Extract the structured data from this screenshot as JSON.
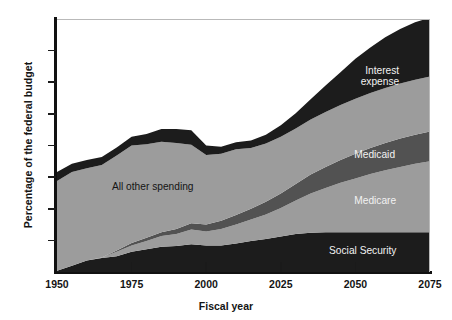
{
  "chart_data": {
    "type": "area",
    "stacked": true,
    "title": "",
    "xlabel": "Fiscal year",
    "ylabel": "Percentage of the federal budget",
    "xlim": [
      1950,
      2075
    ],
    "ylim": [
      0,
      40
    ],
    "xticks": [
      1950,
      1975,
      2000,
      2025,
      2050,
      2075
    ],
    "yticks": [
      0,
      5,
      10,
      15,
      20,
      25,
      30,
      35,
      40
    ],
    "grid": false,
    "legend_position": "inline-annotations",
    "x": [
      1950,
      1955,
      1960,
      1965,
      1970,
      1975,
      1980,
      1985,
      1990,
      1995,
      2000,
      2005,
      2010,
      2015,
      2020,
      2025,
      2030,
      2035,
      2040,
      2045,
      2050,
      2055,
      2060,
      2065,
      2070,
      2075
    ],
    "series": [
      {
        "name": "Social Security",
        "color": "#1c1c1c",
        "values": [
          0.2,
          1.0,
          1.8,
          2.2,
          2.5,
          3.2,
          3.6,
          4.0,
          4.1,
          4.4,
          4.2,
          4.2,
          4.5,
          4.9,
          5.2,
          5.6,
          6.0,
          6.2,
          6.3,
          6.3,
          6.3,
          6.3,
          6.3,
          6.3,
          6.3,
          6.3
        ]
      },
      {
        "name": "Medicare",
        "color": "#9c9c9c",
        "values": [
          0.0,
          0.0,
          0.0,
          0.1,
          0.7,
          1.0,
          1.3,
          1.7,
          1.9,
          2.3,
          2.2,
          2.6,
          3.0,
          3.4,
          3.9,
          4.5,
          5.3,
          6.2,
          7.0,
          7.8,
          8.5,
          9.2,
          9.8,
          10.3,
          10.8,
          11.2
        ]
      },
      {
        "name": "Medicaid",
        "color": "#525252",
        "values": [
          0.0,
          0.0,
          0.0,
          0.0,
          0.2,
          0.4,
          0.5,
          0.6,
          0.8,
          1.0,
          1.1,
          1.3,
          1.5,
          1.7,
          2.0,
          2.3,
          2.6,
          3.0,
          3.3,
          3.6,
          3.9,
          4.1,
          4.3,
          4.5,
          4.6,
          4.7
        ]
      },
      {
        "name": "All other spending",
        "color": "#9c9c9c",
        "values": [
          14.2,
          14.8,
          14.6,
          14.6,
          15.0,
          15.4,
          14.8,
          14.3,
          13.6,
          12.4,
          11.0,
          10.6,
          10.4,
          9.6,
          9.2,
          9.0,
          8.8,
          8.7,
          8.7,
          8.7,
          8.7,
          8.7,
          8.7,
          8.7,
          8.7,
          8.7
        ]
      },
      {
        "name": "Interest expense",
        "color": "#1c1c1c",
        "values": [
          1.4,
          1.3,
          1.3,
          1.3,
          1.3,
          1.4,
          1.6,
          2.0,
          2.2,
          2.3,
          1.5,
          1.1,
          1.1,
          1.2,
          1.4,
          1.8,
          2.4,
          3.2,
          4.2,
          5.2,
          6.3,
          7.2,
          8.0,
          8.6,
          9.1,
          9.3
        ]
      }
    ],
    "annotations": [
      {
        "text": "All other spending",
        "series": "All other spending",
        "x": 1985,
        "y": 13.5,
        "color": "#141414"
      },
      {
        "text": "Interest expense",
        "series": "Interest expense",
        "x": 2062,
        "y": 31.0,
        "color": "#f2f2f2"
      },
      {
        "text": "Medicaid",
        "series": "Medicaid",
        "x": 2057,
        "y": 18.5,
        "color": "#f2f2f2"
      },
      {
        "text": "Medicare",
        "series": "Medicare",
        "x": 2057,
        "y": 11.2,
        "color": "#f2f2f2"
      },
      {
        "text": "Social Security",
        "series": "Social Security",
        "x": 2055,
        "y": 3.3,
        "color": "#f2f2f2"
      }
    ]
  },
  "labels": {
    "interest_expense_line1": "Interest",
    "interest_expense_line2": "expense",
    "medicaid": "Medicaid",
    "medicare": "Medicare",
    "social_security": "Social Security",
    "all_other_spending": "All other spending"
  },
  "axis": {
    "y_title": "Percentage of the federal budget",
    "x_title": "Fiscal year",
    "y_ticks": [
      "0",
      "5",
      "10",
      "15",
      "20",
      "25",
      "30",
      "35",
      "40"
    ],
    "x_ticks": [
      "1950",
      "1975",
      "2000",
      "2025",
      "2050",
      "2075"
    ]
  }
}
